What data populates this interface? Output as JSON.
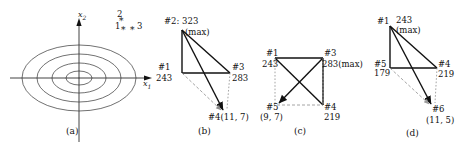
{
  "figure": {
    "panels": [
      {
        "id": "a",
        "caption": "(a)",
        "axis_x_label": "x",
        "axis_x_sub": "1",
        "axis_y_label": "x",
        "axis_y_sub": "2",
        "contour_count": 4,
        "points": [
          {
            "label": "1",
            "marker": "*"
          },
          {
            "label": "2",
            "marker": "*"
          },
          {
            "label": "3",
            "marker": "*"
          }
        ]
      },
      {
        "id": "b",
        "caption": "(b)",
        "vertices": [
          {
            "tag": "#1",
            "value": "243",
            "note": ""
          },
          {
            "tag": "#2:",
            "value": "323",
            "note": "(max)"
          },
          {
            "tag": "#3",
            "value": "283",
            "note": ""
          },
          {
            "tag": "#4(11, 7)",
            "value": "",
            "note": ""
          }
        ]
      },
      {
        "id": "c",
        "caption": "(c)",
        "vertices": [
          {
            "tag": "#1",
            "value": "243",
            "note": ""
          },
          {
            "tag": "#3",
            "value": "283(max)",
            "note": ""
          },
          {
            "tag": "#5",
            "value": "(9, 7)",
            "note": ""
          },
          {
            "tag": "#4",
            "value": "219",
            "note": ""
          }
        ]
      },
      {
        "id": "d",
        "caption": "(d)",
        "vertices": [
          {
            "tag": "#1",
            "value": "243",
            "note": "(max)"
          },
          {
            "tag": "#5",
            "value": "179",
            "note": ""
          },
          {
            "tag": "#4",
            "value": "219",
            "note": ""
          },
          {
            "tag": "#6",
            "value": "(11, 5)",
            "note": ""
          }
        ]
      }
    ]
  },
  "colors": {
    "ink": "#1a1a1a",
    "line": "#000000",
    "dashed": "#8a8a8a",
    "contour": "#333333"
  }
}
